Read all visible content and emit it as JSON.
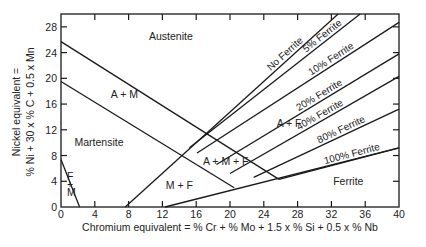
{
  "chart_data": {
    "type": "line",
    "title": "",
    "xlabel": "Chromium equivalent = % Cr + % Mo + 1.5 x % Si + 0.5 x % Nb",
    "ylabel_line1": "Nickel equivalent =",
    "ylabel_line2": "% Ni + 30 x % C + 0.5 x Mn",
    "xlim": [
      0,
      40
    ],
    "ylim": [
      0,
      30
    ],
    "xticks": [
      0,
      4,
      8,
      12,
      16,
      20,
      24,
      28,
      32,
      36,
      40
    ],
    "yticks": [
      0,
      4,
      8,
      12,
      16,
      20,
      24,
      28
    ],
    "grid": false,
    "boundaries": [
      {
        "name": "austenite-martensite-upper",
        "points": [
          [
            0,
            25.7
          ],
          [
            25.8,
            4.3
          ]
        ]
      },
      {
        "name": "martensite-upper",
        "points": [
          [
            0,
            19.5
          ],
          [
            20.5,
            3.0
          ]
        ]
      },
      {
        "name": "no-ferrite",
        "points": [
          [
            7.6,
            0
          ],
          [
            32.8,
            30
          ]
        ]
      },
      {
        "name": "ferrite-martensite",
        "points": [
          [
            0,
            7.4
          ],
          [
            2.2,
            0
          ]
        ]
      },
      {
        "name": "bottom-ferrite",
        "points": [
          [
            12.3,
            0
          ],
          [
            40,
            9.2
          ]
        ]
      }
    ],
    "ferrite_lines": [
      {
        "label": "No Ferrite",
        "points": [
          [
            7.6,
            0
          ],
          [
            32.8,
            30
          ]
        ]
      },
      {
        "label": "5% Ferrite",
        "points": [
          [
            15.2,
            9.2
          ],
          [
            35.4,
            30
          ]
        ]
      },
      {
        "label": "10% Ferrite",
        "points": [
          [
            16.1,
            8.4
          ],
          [
            40,
            28.7
          ]
        ]
      },
      {
        "label": "20% Ferrite",
        "points": [
          [
            18.4,
            6.6
          ],
          [
            40,
            23.8
          ]
        ]
      },
      {
        "label": "40% Ferrite",
        "points": [
          [
            20.0,
            5.2
          ],
          [
            40,
            20.3
          ]
        ]
      },
      {
        "label": "80% Ferrite",
        "points": [
          [
            22.8,
            4.6
          ],
          [
            40,
            15.2
          ]
        ]
      },
      {
        "label": "100% Ferrite",
        "points": [
          [
            25.8,
            4.3
          ],
          [
            40,
            9.2
          ]
        ]
      }
    ],
    "regions": [
      {
        "label": "Austenite",
        "at": [
          13,
          26
        ]
      },
      {
        "label": "A + M",
        "at": [
          7.5,
          17
        ]
      },
      {
        "label": "Martensite",
        "at": [
          4.5,
          9.5
        ]
      },
      {
        "label": "F + M",
        "at": [
          0.6,
          3
        ]
      },
      {
        "label": "M + F",
        "at": [
          14,
          2.8
        ]
      },
      {
        "label": "A + M + F",
        "at": [
          19.5,
          6.6
        ]
      },
      {
        "label": "A + F",
        "at": [
          27,
          12.5
        ]
      },
      {
        "label": "Ferrite",
        "at": [
          34,
          3.4
        ]
      }
    ]
  }
}
